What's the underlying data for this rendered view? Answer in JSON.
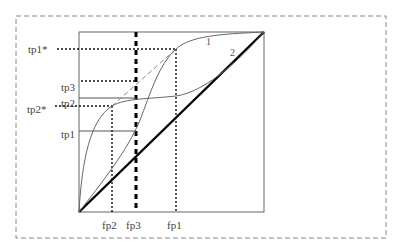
{
  "diagram": {
    "type": "ROC-style threshold curve diagram",
    "colors": {
      "frame": "#666666",
      "curve": "#666666",
      "diagonal": "#000000",
      "guide": "#111111",
      "dashed_curve": "#888888",
      "border": "#888888"
    },
    "x_labels": [
      {
        "id": "fp2",
        "text": "fp2"
      },
      {
        "id": "fp3",
        "text": "fp3"
      },
      {
        "id": "fp1",
        "text": "fp1"
      }
    ],
    "y_labels": [
      {
        "id": "tp1star",
        "text": "tp1*"
      },
      {
        "id": "tp3",
        "text": "tp3"
      },
      {
        "id": "tp2",
        "text": "tp2"
      },
      {
        "id": "tp2star",
        "text": "tp2*"
      },
      {
        "id": "tp1",
        "text": "tp1"
      }
    ],
    "curve_labels": [
      {
        "id": "curve1",
        "text": "1"
      },
      {
        "id": "curve2",
        "text": "2"
      }
    ]
  }
}
